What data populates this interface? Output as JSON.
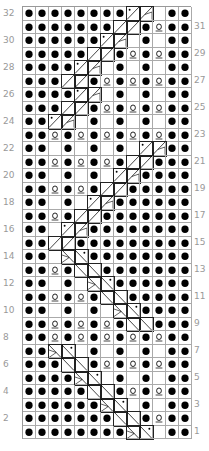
{
  "chart": {
    "columns": 13,
    "rows": 32,
    "legend": {
      "p": "filled-dot",
      "e": "empty",
      "o": "yarn-over-underlined",
      "a": "slash-with-dot",
      "b": "slash-with-triangle",
      "c": "slash",
      "d": "backslash-with-triangle",
      "f": "backslash-with-dot",
      "g": "backslash"
    },
    "row_labels_left": [
      "32",
      "30",
      "28",
      "26",
      "24",
      "22",
      "20",
      "18",
      "16",
      "14",
      "12",
      "10",
      "8",
      "6",
      "4",
      "2"
    ],
    "row_labels_right": [
      "31",
      "29",
      "27",
      "25",
      "23",
      "21",
      "19",
      "17",
      "15",
      "13",
      "11",
      "9",
      "7",
      "5",
      "3",
      "1"
    ],
    "grid": [
      "ppppppppabepp",
      "pppppppccpopp",
      "ppppppabepepp",
      "pppppccpopopp",
      "ppppabepepepp",
      "pppccpopopopp",
      "ppppabepepepp",
      "pppccpopopopp",
      "ppabepepepepp",
      "ppopopopopopp",
      "ppepepepeabpp",
      "ppopopopccppp",
      "ppepepeabpppp",
      "ppopopccppppp",
      "ppepeabpppppp",
      "ppopccppppppp",
      "ppeabpppppppp",
      "ppccppppppppp",
      "ppedfpppppppp",
      "ppopggppppppp",
      "ppepedfpppppp",
      "ppopopggppppp",
      "ppepepedfpppp",
      "ppopopopggppp",
      "ppopopopopopp",
      "ppdfepepepepp",
      "pppggpopopopp",
      "ppppdfepepepp",
      "pppppggpopopp",
      "ppppppdfepepp",
      "pppppppggpopp",
      "ppppppppdfepp"
    ]
  }
}
